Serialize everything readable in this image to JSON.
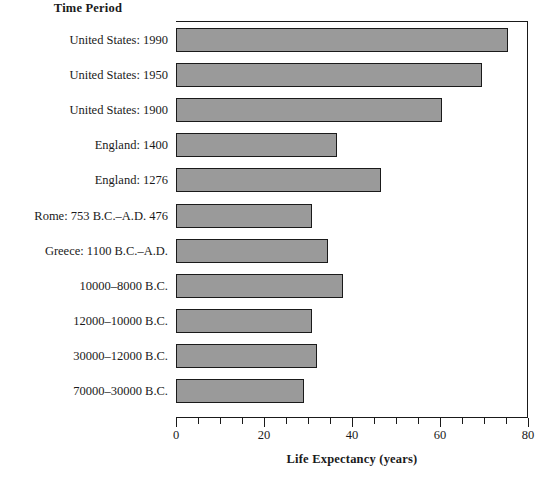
{
  "chart_data": {
    "type": "bar",
    "orientation": "horizontal",
    "title": "",
    "xlabel": "Life Expectancy (years)",
    "ylabel": "Time Period",
    "xlim": [
      0,
      80
    ],
    "xticks": [
      0,
      20,
      40,
      60,
      80
    ],
    "xtick_labels": [
      "0",
      "20",
      "40",
      "60",
      "80"
    ],
    "minor_tick_step": 5,
    "grid": false,
    "legend": null,
    "bar_color": "#9a9a9a",
    "bar_edge_color": "#1a1a1a",
    "categories": [
      "United States: 1990",
      "United States: 1950",
      "United States: 1900",
      "England: 1400",
      "England: 1276",
      "Rome: 753 B.C.–A.D. 476",
      "Greece: 1100 B.C.–A.D.",
      "10000–8000 B.C.",
      "12000–10000 B.C.",
      "30000–12000 B.C.",
      "70000–30000 B.C."
    ],
    "values": [
      75.5,
      69.5,
      60.5,
      36.5,
      46.5,
      31,
      34.5,
      38,
      31,
      32,
      29
    ]
  }
}
